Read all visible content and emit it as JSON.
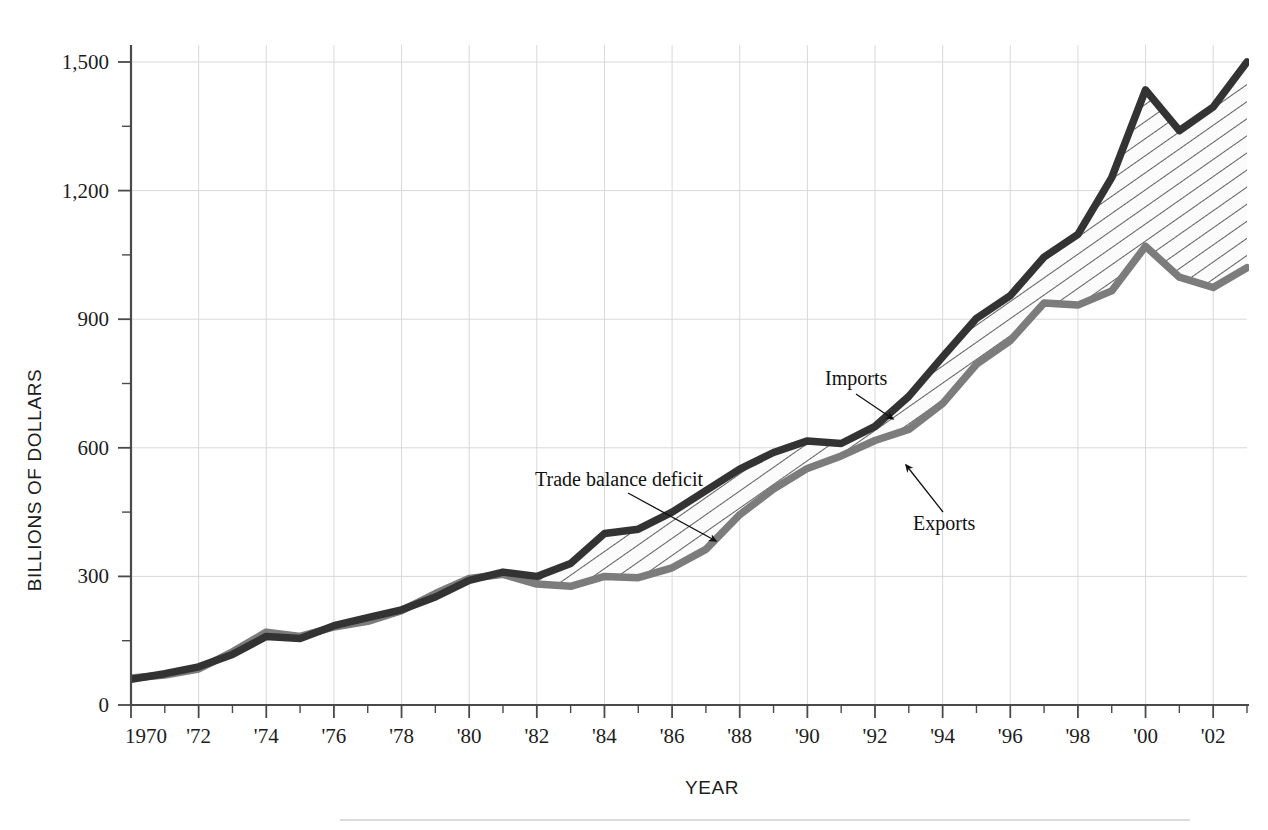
{
  "figure": {
    "background_color": "#ffffff",
    "footer_rule_color": "#cfcfd4"
  },
  "axes": {
    "y_title": "BILLIONS OF DOLLARS",
    "x_title": "YEAR",
    "y_ticks": [
      "0",
      "300",
      "600",
      "900",
      "1,200",
      "1,500"
    ],
    "x_ticks": [
      "1970",
      "'72",
      "'74",
      "'76",
      "'78",
      "'80",
      "'82",
      "'84",
      "'86",
      "'88",
      "'90",
      "'92",
      "'94",
      "'96",
      "'98",
      "'00",
      "'02"
    ]
  },
  "annotations": {
    "imports": {
      "label": "Imports",
      "color": "#333333"
    },
    "exports": {
      "label": "Exports",
      "color": "#7c7c7c"
    },
    "deficit": {
      "label": "Trade balance deficit",
      "color": "#111111"
    }
  },
  "chart_data": {
    "type": "area",
    "title": "",
    "subtitle": "",
    "xlabel": "YEAR",
    "ylabel": "BILLIONS OF DOLLARS",
    "xlim": [
      1970,
      2003
    ],
    "ylim": [
      0,
      1600
    ],
    "yticks": [
      0,
      300,
      600,
      900,
      1200,
      1500
    ],
    "ytick_labels": [
      "0",
      "300",
      "600",
      "900",
      "1,200",
      "1,500"
    ],
    "xticks": [
      1970,
      1972,
      1974,
      1976,
      1978,
      1980,
      1982,
      1984,
      1986,
      1988,
      1990,
      1992,
      1994,
      1996,
      1998,
      2000,
      2002
    ],
    "xtick_labels": [
      "1970",
      "'72",
      "'74",
      "'76",
      "'78",
      "'80",
      "'82",
      "'84",
      "'86",
      "'88",
      "'90",
      "'92",
      "'94",
      "'96",
      "'98",
      "'00",
      "'02"
    ],
    "grid": true,
    "legend": "annotated-inline",
    "fill_between": {
      "pattern": "diagonal-hatch",
      "label": "Trade balance deficit",
      "upper_series": "Imports",
      "lower_series": "Exports"
    },
    "x": [
      1970,
      1971,
      1972,
      1973,
      1974,
      1975,
      1976,
      1977,
      1978,
      1979,
      1980,
      1981,
      1982,
      1983,
      1984,
      1985,
      1986,
      1987,
      1988,
      1989,
      1990,
      1991,
      1992,
      1993,
      1994,
      1995,
      1996,
      1997,
      1998,
      1999,
      2000,
      2001,
      2002,
      2003
    ],
    "series": [
      {
        "name": "Imports",
        "color": "#333333",
        "values": [
          60,
          73,
          89,
          118,
          160,
          155,
          185,
          204,
          222,
          252,
          291,
          310,
          300,
          330,
          400,
          410,
          450,
          500,
          550,
          589,
          616,
          610,
          650,
          720,
          812,
          902,
          955,
          1045,
          1098,
          1230,
          1435,
          1340,
          1395,
          1500
        ]
      },
      {
        "name": "Exports",
        "color": "#7c7c7c",
        "values": [
          63,
          70,
          84,
          124,
          170,
          160,
          182,
          195,
          220,
          260,
          295,
          305,
          282,
          277,
          300,
          297,
          320,
          363,
          444,
          504,
          552,
          581,
          617,
          643,
          703,
          795,
          850,
          938,
          933,
          966,
          1070,
          998,
          974,
          1020
        ]
      }
    ],
    "notes": [
      {
        "text": "Trade balance deficit",
        "points_to": "hatched area"
      },
      {
        "text": "Imports",
        "points_to": "upper line"
      },
      {
        "text": "Exports",
        "points_to": "lower line"
      }
    ]
  }
}
